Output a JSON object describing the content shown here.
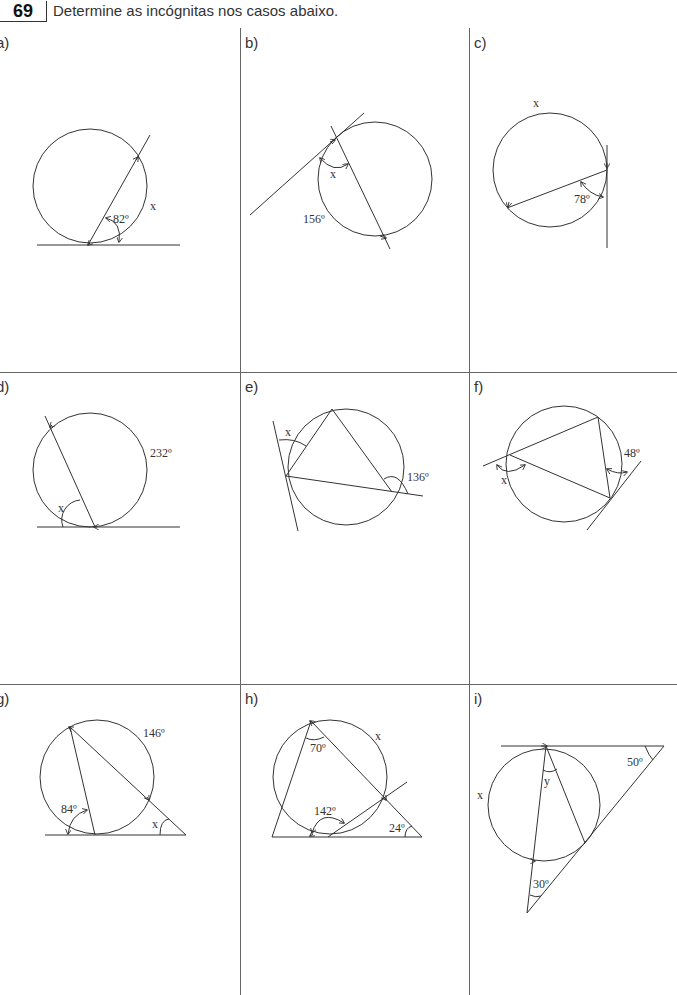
{
  "header": {
    "exercise_number": "69",
    "instruction": "Determine as incógnitas nos casos abaixo."
  },
  "panels": [
    {
      "id": "a",
      "label": "a)",
      "labels": {
        "angle": "82º",
        "unknown": "x"
      }
    },
    {
      "id": "b",
      "label": "b)",
      "labels": {
        "arc": "156º",
        "unknown": "x"
      }
    },
    {
      "id": "c",
      "label": "c)",
      "labels": {
        "angle": "78º",
        "unknown": "x"
      }
    },
    {
      "id": "d",
      "label": "d)",
      "labels": {
        "arc": "232º",
        "unknown": "x"
      }
    },
    {
      "id": "e",
      "label": "e)",
      "labels": {
        "angle": "136º",
        "unknown": "x"
      }
    },
    {
      "id": "f",
      "label": "f)",
      "labels": {
        "angle": "48º",
        "unknown": "x"
      }
    },
    {
      "id": "g",
      "label": "g)",
      "labels": {
        "arc": "146º",
        "angle": "84º",
        "unknown": "x"
      }
    },
    {
      "id": "h",
      "label": "h)",
      "labels": {
        "angle_top": "70º",
        "angle_mid": "142º",
        "angle_right": "24º",
        "unknown": "x"
      }
    },
    {
      "id": "i",
      "label": "i)",
      "labels": {
        "angle_right": "50º",
        "angle_bottom": "30º",
        "unknown_arc": "x",
        "unknown_angle": "y"
      }
    }
  ]
}
